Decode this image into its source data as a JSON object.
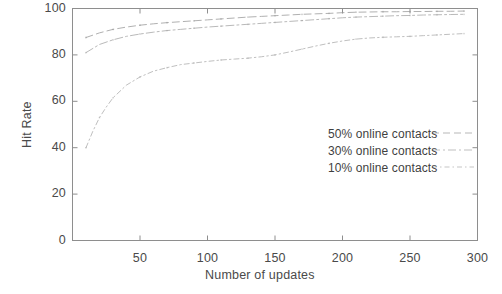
{
  "chart_data": {
    "type": "line",
    "title": "",
    "subtitle": "",
    "xlabel": "Number of updates",
    "ylabel": "Hit Rate",
    "xlim": [
      0,
      300
    ],
    "ylim": [
      0,
      100
    ],
    "xticks": [
      50,
      100,
      150,
      200,
      250,
      300
    ],
    "yticks": [
      0,
      20,
      40,
      60,
      80,
      100
    ],
    "xtick_labels": [
      "50",
      "100",
      "150",
      "200",
      "250",
      "300"
    ],
    "ytick_labels": [
      "0",
      "20",
      "40",
      "60",
      "80",
      "100"
    ],
    "grid": false,
    "legend_position": "center-right",
    "series": [
      {
        "name": "50% online contacts",
        "linestyle": "dashed",
        "color": "#9a9a9a",
        "x": [
          10,
          20,
          30,
          40,
          50,
          60,
          70,
          80,
          90,
          100,
          110,
          120,
          130,
          140,
          150,
          160,
          170,
          180,
          190,
          200,
          210,
          220,
          230,
          240,
          250,
          260,
          270,
          280,
          290
        ],
        "y": [
          87.5,
          89.5,
          91.0,
          92.0,
          92.8,
          93.4,
          93.9,
          94.3,
          94.7,
          95.1,
          95.5,
          95.9,
          96.3,
          96.6,
          96.9,
          97.2,
          97.5,
          97.7,
          97.9,
          98.2,
          98.4,
          98.5,
          98.6,
          98.6,
          98.7,
          98.7,
          98.8,
          98.8,
          98.9
        ]
      },
      {
        "name": "30% online contacts",
        "linestyle": "dash-dot",
        "color": "#a5a5a5",
        "x": [
          10,
          20,
          30,
          40,
          50,
          60,
          70,
          80,
          90,
          100,
          110,
          120,
          130,
          140,
          150,
          160,
          170,
          180,
          190,
          200,
          210,
          220,
          230,
          240,
          250,
          260,
          270,
          280,
          290
        ],
        "y": [
          81.0,
          84.5,
          86.5,
          88.0,
          89.0,
          89.8,
          90.5,
          91.0,
          91.5,
          92.0,
          92.4,
          92.8,
          93.2,
          93.6,
          94.0,
          94.4,
          94.8,
          95.2,
          95.6,
          96.0,
          96.3,
          96.5,
          96.7,
          96.9,
          97.0,
          97.2,
          97.3,
          97.4,
          97.5
        ]
      },
      {
        "name": "10% online contacts",
        "linestyle": "dotted-dash",
        "color": "#adadad",
        "x": [
          10,
          15,
          20,
          25,
          30,
          40,
          50,
          60,
          70,
          80,
          90,
          100,
          110,
          120,
          130,
          140,
          150,
          160,
          170,
          180,
          190,
          200,
          210,
          220,
          230,
          240,
          250,
          260,
          270,
          280,
          290
        ],
        "y": [
          40.0,
          47.0,
          53.0,
          57.5,
          61.5,
          67.0,
          70.5,
          73.0,
          74.5,
          75.8,
          76.5,
          77.2,
          77.8,
          78.2,
          78.6,
          79.2,
          80.0,
          81.2,
          82.5,
          83.8,
          85.0,
          86.0,
          86.8,
          87.3,
          87.6,
          87.8,
          88.0,
          88.3,
          88.6,
          88.9,
          89.2
        ]
      }
    ]
  },
  "axes": {
    "x_title": "Number of updates",
    "y_title": "Hit Rate"
  },
  "legend": {
    "entries": [
      {
        "label": "50% online contacts"
      },
      {
        "label": "30% online contacts"
      },
      {
        "label": "10% online contacts"
      }
    ]
  }
}
